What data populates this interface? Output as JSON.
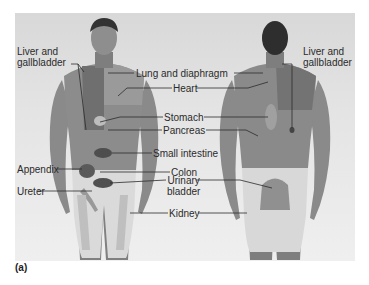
{
  "figure": {
    "caption": "(a)",
    "views": [
      "front",
      "back"
    ]
  },
  "labels": {
    "liver_gallbladder_front_line1": "Liver and",
    "liver_gallbladder_front_line2": "gallbladder",
    "liver_gallbladder_back_line1": "Liver and",
    "liver_gallbladder_back_line2": "gallbladder",
    "lung_diaphragm": "Lung and diaphragm",
    "heart": "Heart",
    "stomach": "Stomach",
    "pancreas": "Pancreas",
    "small_intestine": "Small intestine",
    "appendix": "Appendix",
    "colon": "Colon",
    "urinary_bladder_line1": "Urinary",
    "urinary_bladder_line2": "bladder",
    "ureter": "Ureter",
    "kidney": "Kidney"
  },
  "colors": {
    "panel_bg": "#e2e2e2",
    "skin": "#8a8a8a",
    "skin_dark": "#6e6e6e",
    "hair": "#2e2e2e",
    "underwear": "#dcdcdc",
    "organ_highlight": "#5a5a5a",
    "leader_line": "#2b2b2b"
  }
}
